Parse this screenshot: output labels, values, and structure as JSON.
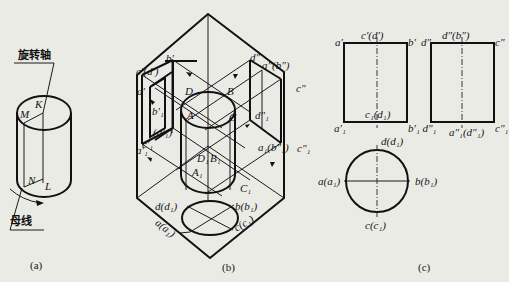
{
  "figure": {
    "panels": [
      {
        "id": "a",
        "caption": "(a)",
        "annotations": {
          "axis_label": "旋转轴",
          "generatrix_label": "母线"
        },
        "points": {
          "K": "K",
          "M": "M",
          "N": "N",
          "L": "L"
        }
      },
      {
        "id": "b",
        "caption": "(b)",
        "points": {
          "c_prime_d_prime": "c′(d′)",
          "b_prime": "b′",
          "a_prime": "a′",
          "b1_prime": "b′₁",
          "d1_prime": "(d′₁)",
          "c1_prime": "c′₁",
          "a1_prime": "a′₁",
          "D": "D",
          "B": "B",
          "A": "A",
          "C": "C",
          "D1": "D₁",
          "B1": "B₁",
          "A1": "A₁",
          "C1": "C₁",
          "d_dprime": "d″",
          "a_dprime_b_dprime": "a″(b″)",
          "c_dprime": "c″",
          "d1_dprime": "d″₁",
          "a1_b1_dprime": "a₁(b″₁)",
          "c1_dprime": "c″₁",
          "d_d1": "d(d₁)",
          "b_b1": "b(b₁)",
          "a_a1": "a(a₁)",
          "c_c1": "c(c₁)"
        }
      },
      {
        "id": "c",
        "caption": "(c)",
        "points": {
          "a_prime": "a′",
          "c_prime_d_prime": "c′(d′)",
          "b_prime": "b′",
          "d_dprime": "d″",
          "d_dprime_b_dprime": "d″(b″)",
          "c_dprime": "c″",
          "c1_d1": "c₁(d₁)",
          "a1_prime": "a′₁",
          "b1_prime_d1_dprime": "b′₁ d″₁",
          "a1_dprime_d1_dprime": "a″₁(d″₁)",
          "c1_dprime": "c″₁",
          "d_d1": "d(d₁)",
          "a_a1": "a(a₁)",
          "b_b1": "b(b₁)",
          "c_c1": "c(c₁)"
        }
      }
    ],
    "colors": {
      "background": "#ebebe6",
      "ink": "#111111"
    }
  }
}
